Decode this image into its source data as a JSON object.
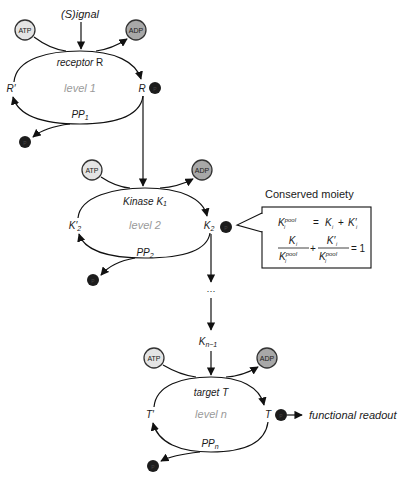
{
  "diagram": {
    "signal_label": "(S)ignal",
    "levels": [
      {
        "id": "level-1",
        "level_label": "level 1",
        "enzyme_label_prefix": "receptor ",
        "enzyme_label_main": "R",
        "inactive_label": "R′",
        "active_label": "R",
        "phosphatase_label": "PP",
        "phosphatase_sub": "1",
        "atp_label": "ATP",
        "adp_label": "ADP"
      },
      {
        "id": "level-2",
        "level_label": "level 2",
        "enzyme_label_prefix": "Kinase K",
        "enzyme_label_sub": "1",
        "inactive_label": "K′",
        "inactive_sub": "2",
        "active_label": "K",
        "active_sub": "2",
        "phosphatase_label": "PP",
        "phosphatase_sub": "2",
        "atp_label": "ATP",
        "adp_label": "ADP"
      },
      {
        "id": "level-n",
        "level_label": "level n",
        "enzyme_label_prefix": "target ",
        "enzyme_label_main": "T",
        "inactive_label": "T′",
        "active_label": "T",
        "phosphatase_label": "PP",
        "phosphatase_sub": "n",
        "atp_label": "ATP",
        "adp_label": "ADP"
      }
    ],
    "ellipsis": "···",
    "intermediate_label": "K",
    "intermediate_sub": "n−1",
    "readout_label": "functional readout",
    "phospho_symbol": "P",
    "conserved_moiety": {
      "title": "Conserved moiety",
      "eq1_lhs": "K",
      "eq1_lhs_sup": "pool",
      "eq1_lhs_sub": "i",
      "eq1_equals": "=",
      "eq1_term1": "K",
      "eq1_term1_sub": "i",
      "eq1_plus": "+",
      "eq1_term2": "K′",
      "eq1_term2_sub": "i",
      "eq2_num1": "K",
      "eq2_num1_sub": "i",
      "eq2_den1": "K",
      "eq2_den1_sup": "pool",
      "eq2_den1_sub": "i",
      "eq2_plus": "+",
      "eq2_num2": "K′",
      "eq2_num2_sub": "i",
      "eq2_den2": "K",
      "eq2_den2_sup": "pool",
      "eq2_den2_sub": "i",
      "eq2_rhs": "= 1"
    },
    "colors": {
      "atp_fill": "#e4e4e4",
      "adp_fill": "#a8a8a8",
      "phospho_fill": "#1c1c1c",
      "level_label": "#9a9a9a",
      "line": "#111111"
    }
  }
}
